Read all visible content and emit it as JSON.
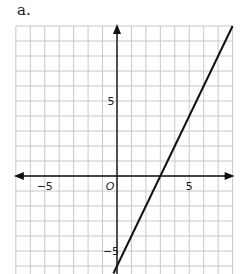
{
  "figure_label": "a.",
  "chart_data": {
    "type": "line",
    "title": "",
    "xlabel": "",
    "ylabel": "",
    "origin_label": "O",
    "xlim": [
      -7,
      8
    ],
    "ylim": [
      -6.5,
      10
    ],
    "grid": true,
    "grid_step": 1,
    "x_tick_labels": [
      {
        "value": -5,
        "label": "−5"
      },
      {
        "value": 5,
        "label": "5"
      }
    ],
    "y_tick_labels": [
      {
        "value": 5,
        "label": "5"
      },
      {
        "value": -5,
        "label": "−5"
      }
    ],
    "series": [
      {
        "name": "line",
        "equation": "y = 2x − 6",
        "slope": 2,
        "intercept": -6,
        "x": [
          0,
          3,
          8
        ],
        "y": [
          -6,
          0,
          10
        ]
      }
    ],
    "colors": {
      "grid": "#c8c8c8",
      "axis": "#111111",
      "line": "#111111"
    }
  }
}
